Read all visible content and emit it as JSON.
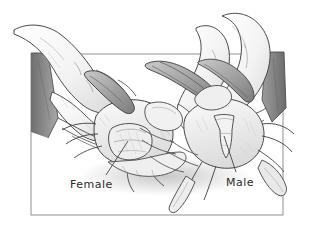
{
  "illustration": {
    "title": "Crab sex identification illustration",
    "description": "Pencil line drawing of two hands holding two blue crabs belly-up, showing the abdominal apron of each crab",
    "style": "graphite pencil line drawing, grayscale",
    "background_color": "#ffffff",
    "ink_color": "#3a3a3a",
    "shade_color": "#8f8f8f",
    "frame": {
      "name": "illustration-border",
      "color": "#9a9a9a",
      "x": 31,
      "y": 54,
      "width": 252,
      "height": 161
    },
    "labels": [
      {
        "id": "female",
        "text": "Female",
        "x": 70,
        "y": 178,
        "leader": {
          "from_x": 106,
          "from_y": 175,
          "to_x": 128,
          "to_y": 141
        }
      },
      {
        "id": "male",
        "text": "Male",
        "x": 226,
        "y": 176,
        "leader": {
          "from_x": 236,
          "from_y": 172,
          "to_x": 224,
          "to_y": 136
        }
      }
    ],
    "subjects": [
      {
        "name": "left-hand",
        "note": "hand entering from upper left holding the female crab"
      },
      {
        "name": "right-hand",
        "note": "hand entering from upper right holding the male crab"
      },
      {
        "name": "female-crab",
        "note": "crab on the left with broad rounded abdominal apron"
      },
      {
        "name": "male-crab",
        "note": "crab on the right with narrow T-shaped abdominal apron"
      },
      {
        "name": "left-sleeve",
        "note": "dark tapered sleeve band at left edge"
      },
      {
        "name": "right-sleeve",
        "note": "dark sleeve band at right edge"
      }
    ]
  }
}
